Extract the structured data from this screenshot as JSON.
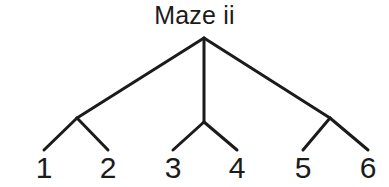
{
  "figure": {
    "title": "Maze ii",
    "background_color": "#ffffff",
    "line_color": "#1b1b1b",
    "text_color": "#1b1b1b",
    "line_width": 3,
    "width": 389,
    "height": 187
  },
  "chart_data": {
    "type": "diagram",
    "diagram_type": "tree",
    "title": "Maze ii",
    "xlabel": "",
    "ylabel": "",
    "grid": false,
    "legend": null,
    "root": {
      "name": "root",
      "x": 204,
      "y": 38
    },
    "internal_nodes": [
      {
        "name": "node-left",
        "x": 77,
        "y": 118
      },
      {
        "name": "node-middle",
        "x": 204,
        "y": 122
      },
      {
        "name": "node-right",
        "x": 330,
        "y": 118
      }
    ],
    "leaves": [
      {
        "label": "1",
        "x": 44,
        "y": 150
      },
      {
        "label": "2",
        "x": 108,
        "y": 150
      },
      {
        "label": "3",
        "x": 173,
        "y": 150
      },
      {
        "label": "4",
        "x": 237,
        "y": 150
      },
      {
        "label": "5",
        "x": 303,
        "y": 150
      },
      {
        "label": "6",
        "x": 368,
        "y": 150
      }
    ],
    "edges": [
      {
        "name": "root-to-left",
        "x1": 204,
        "y1": 38,
        "x2": 77,
        "y2": 118
      },
      {
        "name": "root-to-middle",
        "x1": 204,
        "y1": 38,
        "x2": 204,
        "y2": 122
      },
      {
        "name": "root-to-right",
        "x1": 204,
        "y1": 38,
        "x2": 330,
        "y2": 118
      },
      {
        "name": "left-to-leaf-1",
        "x1": 77,
        "y1": 118,
        "x2": 44,
        "y2": 150
      },
      {
        "name": "left-to-leaf-2",
        "x1": 77,
        "y1": 118,
        "x2": 108,
        "y2": 150
      },
      {
        "name": "middle-to-leaf-3",
        "x1": 204,
        "y1": 122,
        "x2": 173,
        "y2": 150
      },
      {
        "name": "middle-to-leaf-4",
        "x1": 204,
        "y1": 122,
        "x2": 237,
        "y2": 150
      },
      {
        "name": "right-to-leaf-5",
        "x1": 330,
        "y1": 118,
        "x2": 303,
        "y2": 150
      },
      {
        "name": "right-to-leaf-6",
        "x1": 330,
        "y1": 118,
        "x2": 368,
        "y2": 150
      }
    ]
  }
}
